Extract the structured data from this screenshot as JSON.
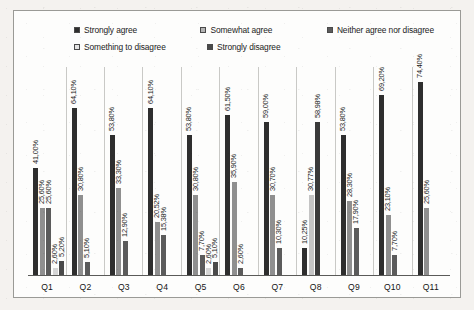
{
  "chart_data": {
    "type": "bar",
    "title": "",
    "subtitle": "",
    "xlabel": "",
    "ylabel": "",
    "ylim": [
      0,
      80
    ],
    "grid": false,
    "legend_position": "top",
    "categories": [
      "Q1",
      "Q2",
      "Q3",
      "Q4",
      "Q5",
      "Q6",
      "Q7",
      "Q8",
      "Q9",
      "Q10",
      "Q11"
    ],
    "series": [
      {
        "name": "Strongly agree",
        "color": "#2e2e2e",
        "values": [
          41.0,
          64.1,
          53.8,
          64.1,
          53.8,
          61.5,
          59.0,
          10.25,
          53.8,
          69.2,
          74.4
        ]
      },
      {
        "name": "Somewhat agree",
        "color": "#8f8f8f",
        "values": [
          25.6,
          30.8,
          33.3,
          20.52,
          30.8,
          35.9,
          30.7,
          30.77,
          28.3,
          23.1,
          25.6
        ]
      },
      {
        "name": "Neither agree nor disagree",
        "color": "#5b5b5b",
        "values": [
          25.6,
          5.1,
          12.9,
          15.38,
          7.7,
          2.6,
          10.3,
          58.98,
          17.9,
          7.7,
          null
        ]
      },
      {
        "name": "Something to disagree",
        "color": "#d6d6d6",
        "values": [
          2.6,
          null,
          null,
          null,
          2.6,
          null,
          null,
          null,
          null,
          null,
          null
        ]
      },
      {
        "name": "Strongly disagree",
        "color": "#4a4a4a",
        "values": [
          5.2,
          null,
          null,
          null,
          5.1,
          null,
          null,
          null,
          null,
          null,
          null
        ]
      }
    ],
    "data_labels": {
      "Q1": [
        "41,00%",
        "25,60%",
        "25,60%",
        "2,60%",
        "5,20%"
      ],
      "Q2": [
        "64,10%",
        "30,80%",
        "5,10%"
      ],
      "Q3": [
        "53,80%",
        "33,30%",
        "12,90%"
      ],
      "Q4": [
        "64,10%",
        "20,52%",
        "15,38%"
      ],
      "Q5": [
        "53,80%",
        "30,80%",
        "7,70%",
        "2,60%",
        "5,10%"
      ],
      "Q6": [
        "61,50%",
        "35,90%",
        "2,60%"
      ],
      "Q7": [
        "59,00%",
        "30,70%",
        "10,30%"
      ],
      "Q8": [
        "10,25%",
        "30,77%",
        "58,98%"
      ],
      "Q9": [
        "53,80%",
        "28,30%",
        "17,90%"
      ],
      "Q10": [
        "69,20%",
        "23,10%",
        "7,70%"
      ],
      "Q11": [
        "74,40%",
        "25,60%"
      ]
    }
  },
  "legend": {
    "rows": [
      [
        {
          "label": "Strongly agree",
          "color": "#2e2e2e",
          "slot": "lg-c1"
        },
        {
          "label": "Somewhat agree",
          "color": "#b4b4b4",
          "slot": "lg-c2"
        },
        {
          "label": "Neither agree nor disagree",
          "color": "#5b5b5b",
          "slot": "lg-c3"
        }
      ],
      [
        {
          "label": "Something to disagree",
          "color": "#e4e4e4",
          "slot": "lg-c1"
        },
        {
          "label": "Strongly disagree",
          "color": "#4a4a4a",
          "slot": "lg-c2"
        }
      ]
    ]
  },
  "axis": {
    "ticks": [
      "Q1",
      "Q2",
      "Q3",
      "Q4",
      "Q5",
      "Q6",
      "Q7",
      "Q8",
      "Q9",
      "Q10",
      "Q11"
    ]
  },
  "groups": [
    {
      "category": "Q1",
      "bars": [
        {
          "value": 41.0,
          "label": "41,00%",
          "color": "#2e2e2e"
        },
        {
          "value": 25.6,
          "label": "25,60%",
          "color": "#8f8f8f"
        },
        {
          "value": 25.6,
          "label": "25,60%",
          "color": "#5b5b5b"
        },
        {
          "value": 2.6,
          "label": "2,60%",
          "color": "#d6d6d6"
        },
        {
          "value": 5.2,
          "label": "5,20%",
          "color": "#4a4a4a"
        }
      ]
    },
    {
      "category": "Q2",
      "bars": [
        {
          "value": 64.1,
          "label": "64,10%",
          "color": "#2e2e2e"
        },
        {
          "value": 30.8,
          "label": "30,80%",
          "color": "#8f8f8f"
        },
        {
          "value": 5.1,
          "label": "5,10%",
          "color": "#5b5b5b"
        }
      ]
    },
    {
      "category": "Q3",
      "bars": [
        {
          "value": 53.8,
          "label": "53,80%",
          "color": "#2e2e2e"
        },
        {
          "value": 33.3,
          "label": "33,30%",
          "color": "#8f8f8f"
        },
        {
          "value": 12.9,
          "label": "12,90%",
          "color": "#5b5b5b"
        }
      ]
    },
    {
      "category": "Q4",
      "bars": [
        {
          "value": 64.1,
          "label": "64,10%",
          "color": "#2e2e2e"
        },
        {
          "value": 20.52,
          "label": "20,52%",
          "color": "#8f8f8f"
        },
        {
          "value": 15.38,
          "label": "15,38%",
          "color": "#5b5b5b"
        }
      ]
    },
    {
      "category": "Q5",
      "bars": [
        {
          "value": 53.8,
          "label": "53,80%",
          "color": "#2e2e2e"
        },
        {
          "value": 30.8,
          "label": "30,80%",
          "color": "#8f8f8f"
        },
        {
          "value": 7.7,
          "label": "7,70%",
          "color": "#5b5b5b"
        },
        {
          "value": 2.6,
          "label": "2,60%",
          "color": "#d6d6d6"
        },
        {
          "value": 5.1,
          "label": "5,10%",
          "color": "#4a4a4a"
        }
      ]
    },
    {
      "category": "Q6",
      "bars": [
        {
          "value": 61.5,
          "label": "61,50%",
          "color": "#2e2e2e"
        },
        {
          "value": 35.9,
          "label": "35,90%",
          "color": "#8f8f8f"
        },
        {
          "value": 2.6,
          "label": "2,60%",
          "color": "#5b5b5b"
        }
      ]
    },
    {
      "category": "Q7",
      "bars": [
        {
          "value": 59.0,
          "label": "59,00%",
          "color": "#2e2e2e"
        },
        {
          "value": 30.7,
          "label": "30,70%",
          "color": "#8f8f8f"
        },
        {
          "value": 10.3,
          "label": "10,30%",
          "color": "#5b5b5b"
        }
      ]
    },
    {
      "category": "Q8",
      "bars": [
        {
          "value": 10.25,
          "label": "10,25%",
          "color": "#2e2e2e"
        },
        {
          "value": 30.77,
          "label": "30,77%",
          "color": "#c4c4c4"
        },
        {
          "value": 58.98,
          "label": "58,98%",
          "color": "#3a3a3a"
        }
      ]
    },
    {
      "category": "Q9",
      "bars": [
        {
          "value": 53.8,
          "label": "53,80%",
          "color": "#2e2e2e"
        },
        {
          "value": 28.3,
          "label": "28,30%",
          "color": "#8f8f8f"
        },
        {
          "value": 17.9,
          "label": "17,90%",
          "color": "#5b5b5b"
        }
      ]
    },
    {
      "category": "Q10",
      "bars": [
        {
          "value": 69.2,
          "label": "69,20%",
          "color": "#2e2e2e"
        },
        {
          "value": 23.1,
          "label": "23,10%",
          "color": "#8f8f8f"
        },
        {
          "value": 7.7,
          "label": "7,70%",
          "color": "#5b5b5b"
        }
      ]
    },
    {
      "category": "Q11",
      "bars": [
        {
          "value": 74.4,
          "label": "74,40%",
          "color": "#2e2e2e"
        },
        {
          "value": 25.6,
          "label": "25,60%",
          "color": "#8f8f8f"
        }
      ]
    }
  ]
}
